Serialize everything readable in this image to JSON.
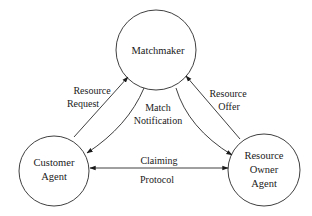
{
  "diagram": {
    "nodes": [
      {
        "id": "matchmaker",
        "lines": [
          "Matchmaker"
        ]
      },
      {
        "id": "customer",
        "lines": [
          "Customer",
          "Agent"
        ]
      },
      {
        "id": "owner",
        "lines": [
          "Resource",
          "Owner",
          "Agent"
        ]
      }
    ],
    "edges": [
      {
        "id": "resource-request",
        "from": "customer",
        "to": "matchmaker",
        "lines": [
          "Resource",
          "Request"
        ]
      },
      {
        "id": "match-notification",
        "from": "matchmaker",
        "to": "customer,owner",
        "lines": [
          "Match",
          "Notification"
        ]
      },
      {
        "id": "resource-offer",
        "from": "owner",
        "to": "matchmaker",
        "lines": [
          "Resource",
          "Offer"
        ]
      },
      {
        "id": "claiming-protocol",
        "from": "customer",
        "to": "owner",
        "bidirectional": true,
        "lines": [
          "Claiming",
          "Protocol"
        ]
      }
    ]
  }
}
